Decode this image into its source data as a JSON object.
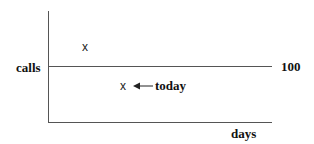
{
  "diagram": {
    "y_axis_label": "calls",
    "x_axis_label": "days",
    "reference_line_label": "100",
    "points": [
      {
        "marker": "x",
        "position": "above reference line"
      },
      {
        "marker": "x",
        "position": "below reference line",
        "annotation": "today"
      }
    ],
    "annotation_arrow": "left-arrow-icon"
  }
}
